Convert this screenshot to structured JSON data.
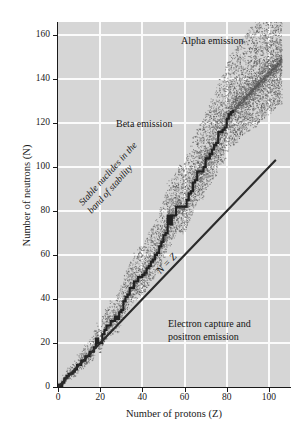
{
  "chart_data": {
    "type": "scatter",
    "title": "",
    "xlabel": "Number of protons (Z)",
    "ylabel": "Number of neutrons (N)",
    "xlim": [
      0,
      110
    ],
    "ylim": [
      0,
      166
    ],
    "xticks": [
      0,
      20,
      40,
      60,
      80,
      100
    ],
    "yticks": [
      0,
      20,
      40,
      60,
      80,
      100,
      120,
      140,
      160
    ],
    "grid": true,
    "grid_color": "#fbfbfb",
    "plot_bgcolor": "#d6d6d6",
    "legend": "none",
    "annotations": [
      {
        "text": "Alpha emission",
        "x": 72,
        "y": 158,
        "rotation": 0
      },
      {
        "text": "Beta emission",
        "x": 22,
        "y": 106,
        "rotation": 0
      },
      {
        "text": "Electron capture and positron emission",
        "x": 48,
        "y": 38,
        "rotation": 0
      },
      {
        "text": "N = Z",
        "x": 44,
        "y": 48,
        "rotation": 46,
        "italic": true
      },
      {
        "text": "Stable nuclides in the band of stability",
        "x": 12,
        "y": 68,
        "rotation": 48,
        "italic": true
      }
    ],
    "series": [
      {
        "name": "N = Z line",
        "type": "line",
        "color": "#2b2b2b",
        "linewidth": 2.2,
        "x": [
          0,
          103
        ],
        "y": [
          0,
          103
        ]
      },
      {
        "name": "Stable nuclides (band of stability)",
        "type": "staircase",
        "color": "#222222",
        "x": [
          0,
          1,
          2,
          3,
          4,
          5,
          6,
          7,
          8,
          9,
          10,
          11,
          12,
          13,
          14,
          15,
          16,
          17,
          18,
          19,
          20,
          21,
          22,
          23,
          24,
          25,
          26,
          27,
          28,
          29,
          30,
          31,
          32,
          33,
          34,
          35,
          36,
          37,
          38,
          39,
          40,
          41,
          42,
          43,
          44,
          45,
          46,
          47,
          48,
          49,
          50,
          51,
          52,
          53,
          54,
          55,
          56,
          57,
          58,
          59,
          60,
          61,
          62,
          63,
          64,
          65,
          66,
          67,
          68,
          69,
          70,
          71,
          72,
          73,
          74,
          75,
          76,
          77,
          78,
          79,
          80,
          81,
          82,
          83
        ],
        "y": [
          1,
          0,
          2,
          4,
          5,
          6,
          6,
          7,
          8,
          10,
          10,
          12,
          12,
          14,
          14,
          16,
          16,
          18,
          22,
          20,
          20,
          24,
          26,
          28,
          28,
          30,
          30,
          32,
          31,
          34,
          35,
          39,
          41,
          42,
          45,
          45,
          48,
          48,
          50,
          50,
          51,
          52,
          54,
          55,
          57,
          58,
          60,
          61,
          64,
          66,
          69,
          70,
          78,
          74,
          78,
          78,
          82,
          82,
          82,
          82,
          82,
          85,
          88,
          89,
          93,
          94,
          98,
          98,
          98,
          100,
          104,
          104,
          106,
          108,
          110,
          111,
          116,
          116,
          117,
          118,
          122,
          124,
          125,
          126
        ]
      },
      {
        "name": "Unstable nuclide stipple band",
        "type": "stipple",
        "color": "#5a5a5a",
        "description": "Dense dotted band straddling the stable-nuclide staircase, widening with increasing Z and reaching N = 160 at Z = 105."
      }
    ]
  },
  "axis": {
    "x_title": "Number of protons (Z)",
    "y_title": "Number of neutrons (N)",
    "x_ticklabels": [
      "0",
      "20",
      "40",
      "60",
      "80",
      "100"
    ],
    "y_ticklabels": [
      "0",
      "20",
      "40",
      "60",
      "80",
      "100",
      "120",
      "140",
      "160"
    ]
  },
  "annotations": {
    "alpha": "Alpha emission",
    "beta": "Beta emission",
    "electron_capture_line1": "Electron capture and",
    "electron_capture_line2": "positron emission",
    "nz_line": "N = Z",
    "band_line1": "Stable nuclides in the",
    "band_line2": "band of stability"
  }
}
